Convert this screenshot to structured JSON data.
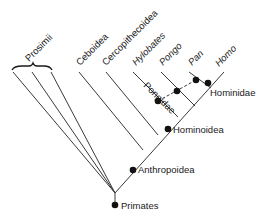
{
  "diagram": {
    "type": "cladogram",
    "colors": {
      "line": "#3a3a3a",
      "node": "#111111",
      "text": "#1a1a1a",
      "background": "#ffffff"
    },
    "taxa_tips": [
      {
        "id": "prosimii",
        "label": "Prosimii"
      },
      {
        "id": "ceboidea",
        "label": "Ceboidea"
      },
      {
        "id": "cercopithecoidea",
        "label": "Cercopithecoidea"
      },
      {
        "id": "hylobates",
        "label": "Hylobates"
      },
      {
        "id": "pongo",
        "label": "Pongo"
      },
      {
        "id": "pan",
        "label": "Pan"
      },
      {
        "id": "homo",
        "label": "Homo"
      }
    ],
    "nodes": [
      {
        "id": "primates",
        "label": "Primates"
      },
      {
        "id": "anthropoidea",
        "label": "Anthropoidea"
      },
      {
        "id": "hominoidea",
        "label": "Hominoidea"
      },
      {
        "id": "pongidae",
        "label": "Pongidae"
      },
      {
        "id": "hominidae",
        "label": "Hominidae"
      }
    ]
  }
}
